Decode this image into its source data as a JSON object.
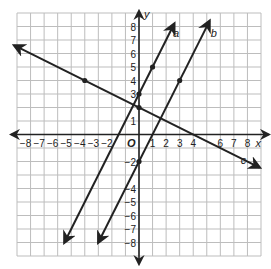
{
  "graph": {
    "x_axis_label": "x",
    "y_axis_label": "y",
    "origin_label": "O",
    "x_ticks": [
      "-8",
      "-7",
      "-6",
      "-5",
      "-4",
      "-3",
      "-2",
      "1",
      "2",
      "3",
      "4",
      "6",
      "7",
      "8"
    ],
    "y_ticks": [
      "8",
      "7",
      "6",
      "5",
      "4",
      "3",
      "1",
      "-2",
      "-4",
      "-5",
      "-6",
      "-7",
      "-8"
    ],
    "grid_range": [
      -9,
      9
    ],
    "colors": {
      "grid": "#bdbdbd",
      "axis": "#222222",
      "line": "#222222"
    }
  },
  "lines": [
    {
      "name": "a",
      "label": "a",
      "equation": "y = 2x + 3",
      "points": [
        [
          0,
          3
        ],
        [
          1,
          5
        ]
      ]
    },
    {
      "name": "b",
      "label": "b",
      "equation": "y = 2x - 2",
      "points": [
        [
          0,
          -2
        ],
        [
          3,
          4
        ]
      ]
    },
    {
      "name": "c",
      "label": "c",
      "equation": "y = -x/2 + 2",
      "points": [
        [
          -4,
          4
        ],
        [
          0,
          2
        ]
      ]
    }
  ]
}
